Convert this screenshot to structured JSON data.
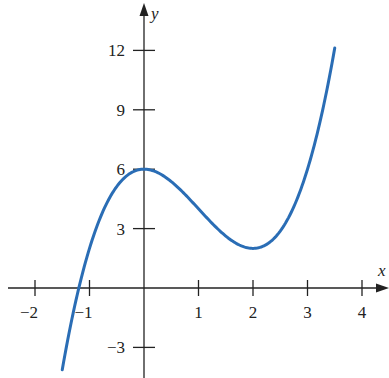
{
  "chart_data": {
    "type": "line",
    "title": "",
    "function": "y = x^3 - 3x^2 + 6",
    "xlabel": "x",
    "ylabel": "y",
    "xlim": [
      -2.2,
      4.4
    ],
    "ylim": [
      -4.2,
      13.5
    ],
    "x_ticks": [
      -2,
      -1,
      1,
      2,
      3,
      4
    ],
    "x_tick_labels": [
      "−2",
      "−1",
      "1",
      "2",
      "3",
      "4"
    ],
    "y_ticks": [
      12,
      9,
      6,
      3,
      -3
    ],
    "y_tick_labels": [
      "12",
      "9",
      "6",
      "3",
      "−3"
    ],
    "grid": false,
    "legend": null,
    "series": [
      {
        "name": "f(x)",
        "color": "#2a6db5",
        "x_range": [
          -1.5,
          3.5
        ],
        "key_points": [
          {
            "x": -1.5,
            "y": -4.125
          },
          {
            "x": -1.2,
            "y": 0.0
          },
          {
            "x": -1,
            "y": 2
          },
          {
            "x": 0,
            "y": 6,
            "note": "local maximum"
          },
          {
            "x": 1,
            "y": 4
          },
          {
            "x": 2,
            "y": 2,
            "note": "local minimum"
          },
          {
            "x": 3,
            "y": 6
          },
          {
            "x": 3.5,
            "y": 12.125
          }
        ]
      }
    ]
  },
  "axes": {
    "x_name": "x",
    "y_name": "y",
    "axis_color": "#222222"
  }
}
